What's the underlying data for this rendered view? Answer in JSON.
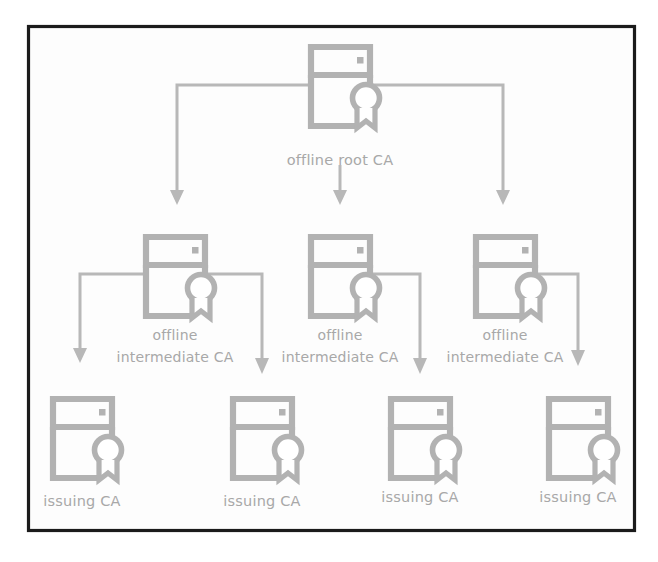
{
  "diagram": {
    "colors": {
      "frame_border": "#1b1b1b",
      "icon_stroke": "#b2b2b2",
      "connector_stroke": "#b8b8b8",
      "label_text": "#a8a8a8",
      "background": "#ffffff"
    },
    "icon_name": "server-with-certificate-icon",
    "levels": [
      {
        "id": "root",
        "nodes": [
          {
            "id": "root-ca",
            "label_lines": [
              "offline root CA"
            ],
            "x": 340,
            "y": 85
          }
        ]
      },
      {
        "id": "intermediate",
        "nodes": [
          {
            "id": "intermediate-ca-1",
            "label_lines": [
              "offline",
              "intermediate CA"
            ],
            "x": 175,
            "y": 275
          },
          {
            "id": "intermediate-ca-2",
            "label_lines": [
              "offline",
              "intermediate CA"
            ],
            "x": 340,
            "y": 275
          },
          {
            "id": "intermediate-ca-3",
            "label_lines": [
              "offline",
              "intermediate CA"
            ],
            "x": 505,
            "y": 275
          }
        ]
      },
      {
        "id": "issuing",
        "nodes": [
          {
            "id": "issuing-ca-1",
            "label_lines": [
              "issuing CA"
            ],
            "x": 82,
            "y": 440
          },
          {
            "id": "issuing-ca-2",
            "label_lines": [
              "issuing CA"
            ],
            "x": 262,
            "y": 440
          },
          {
            "id": "issuing-ca-3",
            "label_lines": [
              "issuing CA"
            ],
            "x": 420,
            "y": 440
          },
          {
            "id": "issuing-ca-4",
            "label_lines": [
              "issuing CA"
            ],
            "x": 578,
            "y": 440
          }
        ]
      }
    ],
    "edges": [
      {
        "id": "edge-root-to-int1",
        "from": "root-ca",
        "to": "intermediate-ca-1"
      },
      {
        "id": "edge-root-to-int2",
        "from": "root-ca",
        "to": "intermediate-ca-2"
      },
      {
        "id": "edge-root-to-int3",
        "from": "root-ca",
        "to": "intermediate-ca-3"
      },
      {
        "id": "edge-int1-to-iss1",
        "from": "intermediate-ca-1",
        "to": "issuing-ca-1"
      },
      {
        "id": "edge-int1-to-iss2",
        "from": "intermediate-ca-1",
        "to": "issuing-ca-2"
      },
      {
        "id": "edge-int2-to-iss3",
        "from": "intermediate-ca-2",
        "to": "issuing-ca-3"
      },
      {
        "id": "edge-int3-to-iss4",
        "from": "intermediate-ca-3",
        "to": "issuing-ca-4"
      }
    ],
    "labels": {
      "root_ca": "offline root CA",
      "offline": "offline",
      "intermediate_ca": "intermediate CA",
      "issuing_ca": "issuing CA"
    }
  }
}
